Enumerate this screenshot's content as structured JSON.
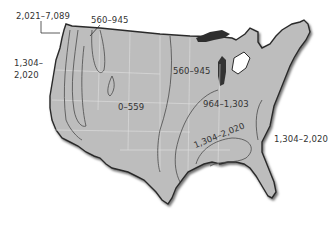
{
  "map": {
    "type": "thematic-contour",
    "region": "Continental United States",
    "colors": {
      "land": "#bdbdbd",
      "outline": "#2a2a2a",
      "contour": "#4a4a4a",
      "state_lines": "#e4e4e4",
      "water": "#ffffff",
      "label_text": "#333333"
    },
    "labels": [
      {
        "id": "nw-coast-high",
        "text": "2,021–7,089"
      },
      {
        "id": "northern-rockies",
        "text": "560–945"
      },
      {
        "id": "west-coast-line1",
        "text": "1,304–"
      },
      {
        "id": "west-coast-line2",
        "text": "2,020"
      },
      {
        "id": "great-plains",
        "text": "560–945"
      },
      {
        "id": "interior-west",
        "text": "0–559"
      },
      {
        "id": "midwest-east",
        "text": "964–1,303"
      },
      {
        "id": "southeast-inland",
        "text": "1,304–2,020"
      },
      {
        "id": "southeast-coast",
        "text": "1,304–2,020"
      }
    ]
  }
}
